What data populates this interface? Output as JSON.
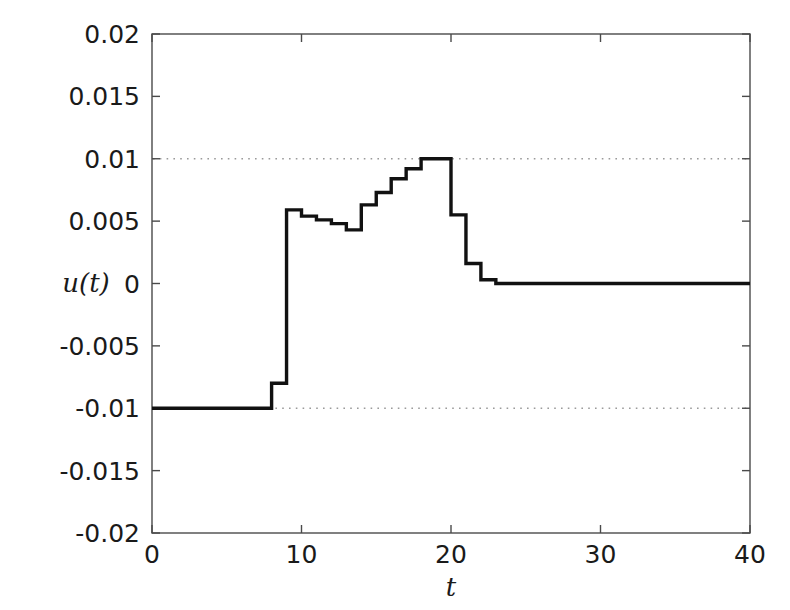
{
  "figure": {
    "width": 790,
    "height": 610,
    "background": "#ffffff",
    "line_color": "#111111",
    "axis_color": "#4a4a4a",
    "grid_color": "#9a9a9a"
  },
  "axes": {
    "left_px": 152,
    "right_px": 750,
    "top_px": 34,
    "bottom_px": 533
  },
  "labels": {
    "y_axis_title": "u(t)",
    "x_axis_title": "t"
  },
  "chart_data": {
    "type": "line",
    "title": "",
    "xlabel": "t",
    "ylabel": "u(t)",
    "xlim": [
      0,
      40
    ],
    "ylim": [
      -0.02,
      0.02
    ],
    "xticks": [
      0,
      10,
      20,
      30,
      40
    ],
    "xticklabels": [
      "0",
      "10",
      "20",
      "30",
      "40"
    ],
    "yticks": [
      -0.02,
      -0.015,
      -0.01,
      -0.005,
      0,
      0.005,
      0.01,
      0.015,
      0.02
    ],
    "yticklabels": [
      "-0.02",
      "-0.015",
      "-0.01",
      "-0.005",
      "0",
      "0.005",
      "0.01",
      "0.015",
      "0.02"
    ],
    "grid": false,
    "legend": null,
    "reference_lines": [
      {
        "axis": "y",
        "value": 0.01,
        "style": "dotted"
      },
      {
        "axis": "y",
        "value": -0.01,
        "style": "dotted"
      }
    ],
    "drawstyle": "steps-post",
    "series": [
      {
        "name": "u(t)",
        "color": "#111111",
        "x": [
          0,
          8,
          9,
          10,
          11,
          12,
          13,
          14,
          15,
          16,
          17,
          18,
          19,
          20,
          21,
          22,
          23,
          40
        ],
        "values": [
          -0.01,
          -0.008,
          0.0059,
          0.0054,
          0.0051,
          0.0048,
          0.0043,
          0.0063,
          0.0073,
          0.0084,
          0.0092,
          0.01,
          0.01,
          0.0055,
          0.0016,
          0.0003,
          0.0,
          0.0
        ]
      }
    ]
  }
}
